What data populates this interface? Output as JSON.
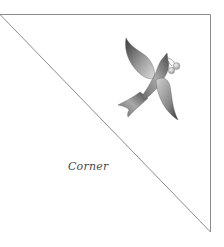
{
  "figure": {
    "label": "Corner",
    "shape": "right-triangle",
    "stroke_color": "#8a8a8a",
    "illustration": "bird-with-cherries-icon"
  },
  "colors": {
    "background": "#ffffff",
    "outline": "#8a8a8a",
    "bird_dark": "#3c3c3c",
    "bird_light": "#d8d8d8",
    "berries": "#c9c9c9",
    "text": "#4a4a4a"
  }
}
